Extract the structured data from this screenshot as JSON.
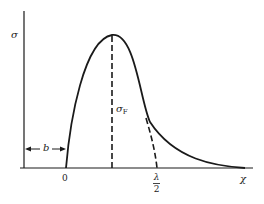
{
  "diagram": {
    "type": "stress-distribution-curve",
    "labels": {
      "y_axis": "σ",
      "peak_label_main": "σ",
      "peak_label_sub": "F",
      "offset_label": "b",
      "origin": "0",
      "half_wavelength_num": "λ",
      "half_wavelength_den": "2",
      "x_axis": "χ"
    },
    "elements": [
      {
        "name": "y-axis",
        "kind": "solid-line"
      },
      {
        "name": "x-axis",
        "kind": "solid-line"
      },
      {
        "name": "stress-curve",
        "kind": "solid-curve",
        "description": "rises from 0, peaks, decays toward χ"
      },
      {
        "name": "peak-dashed-line",
        "kind": "dashed-line",
        "description": "vertical from curve peak to baseline"
      },
      {
        "name": "half-wavelength-dashed-curve",
        "kind": "dashed-curve",
        "description": "from descending curve down to λ/2"
      },
      {
        "name": "offset-dimension-arrow",
        "kind": "double-arrow",
        "description": "spans from y-axis to origin 0, labeled b"
      }
    ],
    "colors": {
      "stroke": "#1a1a1a",
      "background": "#ffffff"
    }
  }
}
